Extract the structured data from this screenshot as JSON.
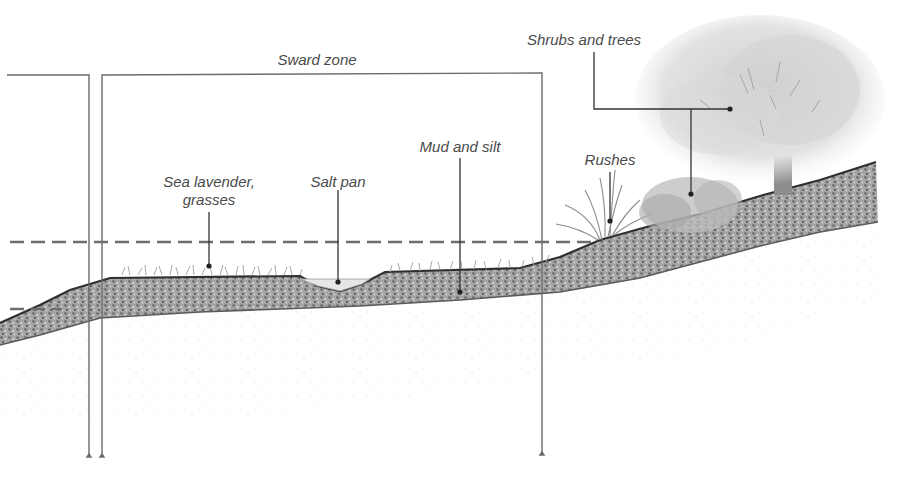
{
  "diagram": {
    "type": "cross-section",
    "zones": [
      {
        "id": "left-zone",
        "label": ""
      },
      {
        "id": "sward-zone",
        "label": "Sward zone"
      }
    ],
    "labels": {
      "sward_zone": "Sward zone",
      "sea_lavender_line1": "Sea lavender,",
      "sea_lavender_line2": "grasses",
      "salt_pan": "Salt pan",
      "mud_and_silt": "Mud and silt",
      "rushes": "Rushes",
      "shrubs_and_trees": "Shrubs and trees"
    },
    "water_levels": [
      {
        "name": "high-tide-line",
        "style": "dashed",
        "y": 242
      },
      {
        "name": "low-tide-line",
        "style": "dashed",
        "y": 309
      }
    ],
    "colors": {
      "line": "#6b6b6b",
      "leader": "#3a3a3a",
      "sediment_dark": "#4d4d4d",
      "sediment_light": "#bdbdbd",
      "vegetation": "#9a9a9a",
      "text": "#4a4a4a",
      "background": "#ffffff"
    }
  }
}
